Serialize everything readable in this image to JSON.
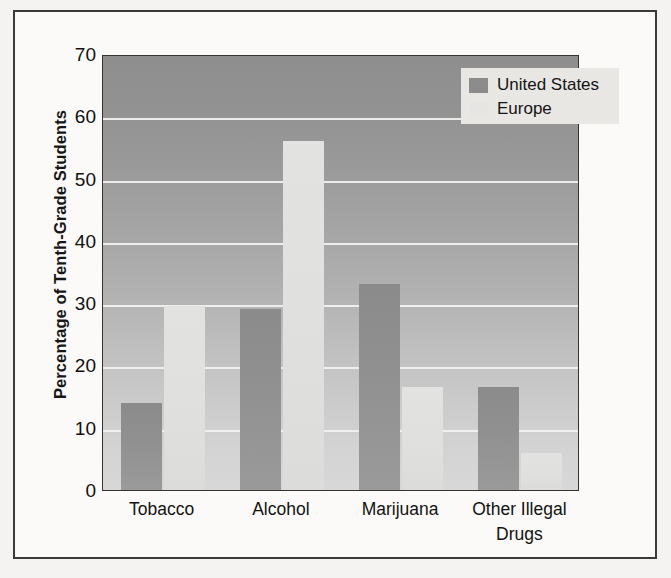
{
  "chart_data": {
    "type": "bar",
    "title": "",
    "subtitle": "",
    "xlabel": "",
    "ylabel": "Percentage of Tenth-Grade Students",
    "categories": [
      "Tobacco",
      "Alcohol",
      "Marijuana",
      "Other Illegal Drugs"
    ],
    "category_lines": [
      [
        "Tobacco"
      ],
      [
        "Alcohol"
      ],
      [
        "Marijuana"
      ],
      [
        "Other Illegal",
        "Drugs"
      ]
    ],
    "series": [
      {
        "name": "United States",
        "color": "#8c8c8c",
        "values": [
          14,
          29,
          33,
          16.5
        ]
      },
      {
        "name": "Europe",
        "color": "#e4e3e1",
        "values": [
          29.5,
          56,
          16.5,
          6
        ]
      }
    ],
    "ylim": [
      0,
      70
    ],
    "ytick_values": [
      0,
      10,
      20,
      30,
      40,
      50,
      60,
      70
    ],
    "ytick_labels": [
      "0",
      "10",
      "20",
      "30",
      "40",
      "50",
      "60",
      "70"
    ],
    "ytick_step": 10,
    "grid": true,
    "grid_color": "#f2f2f0",
    "grid_orientation": "horizontal",
    "legend_position": "top-right",
    "plot_background": "gray-gradient"
  },
  "legend": {
    "entries": [
      {
        "label": "United States",
        "swatch": "legend-swatch-united-states"
      },
      {
        "label": "Europe",
        "swatch": "legend-swatch-europe"
      }
    ]
  }
}
